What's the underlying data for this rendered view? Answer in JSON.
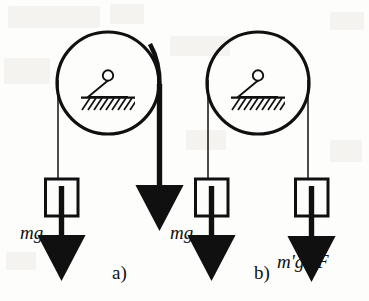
{
  "figure": {
    "name": "pulley-force-comparison-figure",
    "background_color": "#fdfdfc",
    "ink_color": "#101010",
    "panels": [
      {
        "id": "a",
        "caption": "a)",
        "caption_x": 112,
        "caption_y": 278,
        "pulley": {
          "cx": 108,
          "cy": 83,
          "r": 51,
          "stroke_width": 3.2,
          "mount": {
            "pivot_cx": 108,
            "pivot_cy": 76,
            "pivot_r": 5.2,
            "triangle_half_width": 21,
            "ground_y": 97,
            "ground_half_width": 27,
            "hatch_count": 9
          }
        },
        "left_side": {
          "type": "hanging-mass",
          "string_x": 58,
          "string_top": 83,
          "string_bottom": 179,
          "block": {
            "x": 45,
            "y": 179,
            "w": 33,
            "h": 37
          },
          "arrow": {
            "x": 61,
            "y_top": 186,
            "y_bottom": 246,
            "width": 5.5
          },
          "label": "mg",
          "label_x": 20,
          "label_y": 239
        },
        "right_side": {
          "type": "applied-force",
          "string_x": 159,
          "string_top": 83,
          "arrow": {
            "x": 159,
            "y_top": 84,
            "y_bottom": 196,
            "width": 5.5
          },
          "label": "F",
          "label_x": 155,
          "label_y": 213
        }
      },
      {
        "id": "b",
        "caption": "b)",
        "caption_x": 254,
        "caption_y": 278,
        "pulley": {
          "cx": 258,
          "cy": 83,
          "r": 51,
          "stroke_width": 3.2,
          "mount": {
            "pivot_cx": 258,
            "pivot_cy": 76,
            "pivot_r": 5.2,
            "triangle_half_width": 21,
            "ground_y": 97,
            "ground_half_width": 27,
            "hatch_count": 9
          }
        },
        "left_side": {
          "type": "hanging-mass",
          "string_x": 208,
          "string_top": 83,
          "string_bottom": 179,
          "block": {
            "x": 195,
            "y": 179,
            "w": 33,
            "h": 37
          },
          "arrow": {
            "x": 211,
            "y_top": 186,
            "y_bottom": 246,
            "width": 5.5
          },
          "label": "mg",
          "label_x": 170,
          "label_y": 239
        },
        "right_side": {
          "type": "hanging-mass",
          "string_x": 308,
          "string_top": 83,
          "string_bottom": 179,
          "block": {
            "x": 295,
            "y": 179,
            "w": 33,
            "h": 37
          },
          "arrow": {
            "x": 311,
            "y_top": 186,
            "y_bottom": 247,
            "width": 5.5
          },
          "label": "m'g=F",
          "label_x": 277,
          "label_y": 267
        }
      }
    ]
  }
}
